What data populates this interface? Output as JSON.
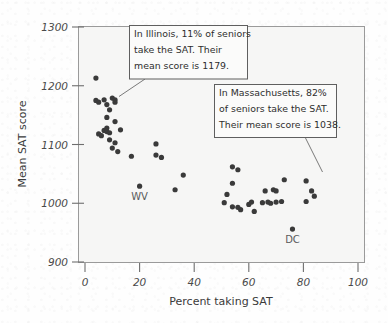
{
  "chart_data": {
    "type": "scatter",
    "title": "",
    "xlabel": "Percent taking SAT",
    "ylabel": "Mean SAT score",
    "xlim": [
      0,
      100
    ],
    "ylim": [
      900,
      1300
    ],
    "xticks": [
      0,
      20,
      40,
      60,
      80,
      100
    ],
    "yticks": [
      900,
      1000,
      1100,
      1200,
      1300
    ],
    "grid": false,
    "legend": "none",
    "point_color": "#3a3a3a",
    "points": [
      {
        "x": 4,
        "y": 1213
      },
      {
        "x": 4,
        "y": 1175
      },
      {
        "x": 5,
        "y": 1172
      },
      {
        "x": 7,
        "y": 1176
      },
      {
        "x": 8,
        "y": 1168
      },
      {
        "x": 9,
        "y": 1159
      },
      {
        "x": 10,
        "y": 1179,
        "label": "Illinois"
      },
      {
        "x": 11,
        "y": 1176
      },
      {
        "x": 11,
        "y": 1172
      },
      {
        "x": 8,
        "y": 1146
      },
      {
        "x": 11,
        "y": 1139
      },
      {
        "x": 5,
        "y": 1118
      },
      {
        "x": 6,
        "y": 1115
      },
      {
        "x": 7,
        "y": 1124
      },
      {
        "x": 8,
        "y": 1122
      },
      {
        "x": 8,
        "y": 1128
      },
      {
        "x": 9,
        "y": 1120
      },
      {
        "x": 13,
        "y": 1125
      },
      {
        "x": 9,
        "y": 1108
      },
      {
        "x": 11,
        "y": 1103
      },
      {
        "x": 10,
        "y": 1094
      },
      {
        "x": 12,
        "y": 1088
      },
      {
        "x": 17,
        "y": 1080
      },
      {
        "x": 26,
        "y": 1101
      },
      {
        "x": 26,
        "y": 1082
      },
      {
        "x": 28,
        "y": 1078
      },
      {
        "x": 20,
        "y": 1029,
        "label": "WV"
      },
      {
        "x": 36,
        "y": 1048
      },
      {
        "x": 33,
        "y": 1023
      },
      {
        "x": 54,
        "y": 1062
      },
      {
        "x": 56,
        "y": 1057
      },
      {
        "x": 54,
        "y": 1034
      },
      {
        "x": 52,
        "y": 1015
      },
      {
        "x": 51,
        "y": 1001
      },
      {
        "x": 54,
        "y": 994
      },
      {
        "x": 56,
        "y": 993
      },
      {
        "x": 57,
        "y": 989
      },
      {
        "x": 60,
        "y": 998
      },
      {
        "x": 61,
        "y": 1002
      },
      {
        "x": 62,
        "y": 986
      },
      {
        "x": 65,
        "y": 1001
      },
      {
        "x": 66,
        "y": 1021
      },
      {
        "x": 67,
        "y": 1002
      },
      {
        "x": 68,
        "y": 1000
      },
      {
        "x": 69,
        "y": 1023
      },
      {
        "x": 70,
        "y": 1021
      },
      {
        "x": 70,
        "y": 1002
      },
      {
        "x": 72,
        "y": 1003
      },
      {
        "x": 73,
        "y": 1040
      },
      {
        "x": 76,
        "y": 956,
        "label": "DC"
      },
      {
        "x": 81,
        "y": 1038,
        "label": "Massachusetts"
      },
      {
        "x": 81,
        "y": 1003
      },
      {
        "x": 83,
        "y": 1021
      },
      {
        "x": 84,
        "y": 1012
      }
    ],
    "annotations": [
      {
        "id": "illinois",
        "lines": [
          "In Illinois, 11% of seniors",
          "take the SAT. Their",
          "mean score is 1179."
        ],
        "points_to": {
          "x": 10,
          "y": 1179
        }
      },
      {
        "id": "massachusetts",
        "lines": [
          "In Massachusetts, 82%",
          "of seniors take the SAT.",
          "Their mean score is 1038."
        ],
        "points_to": {
          "x": 81,
          "y": 1038
        }
      }
    ],
    "point_labels": [
      {
        "text": "WV",
        "near": {
          "x": 20,
          "y": 1029
        }
      },
      {
        "text": "DC",
        "near": {
          "x": 76,
          "y": 956
        }
      }
    ]
  }
}
